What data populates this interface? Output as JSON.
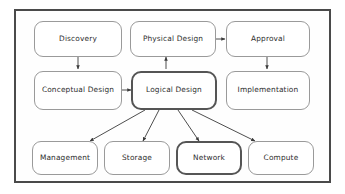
{
  "diagram": {
    "frame": {
      "border_color": "#4a4a4a"
    },
    "node_style": {
      "fill": "#ffffff",
      "border_color": "#9a9a9a",
      "emphasis_border_color": "#555555",
      "text_color": "#2d2d2d"
    },
    "connector_color": "#3a3a3a",
    "rows": [
      {
        "name": "row-top",
        "nodes": [
          {
            "id": "discovery",
            "label": "Discovery",
            "emphasis": false
          },
          {
            "id": "physical-design",
            "label": "Physical Design",
            "emphasis": false
          },
          {
            "id": "approval",
            "label": "Approval",
            "emphasis": false
          }
        ]
      },
      {
        "name": "row-middle",
        "nodes": [
          {
            "id": "conceptual-design",
            "label": "Conceptual Design",
            "emphasis": false
          },
          {
            "id": "logical-design",
            "label": "Logical Design",
            "emphasis": true
          },
          {
            "id": "implementation",
            "label": "Implementation",
            "emphasis": false
          }
        ]
      },
      {
        "name": "row-bottom",
        "nodes": [
          {
            "id": "management",
            "label": "Management",
            "emphasis": false
          },
          {
            "id": "storage",
            "label": "Storage",
            "emphasis": false
          },
          {
            "id": "network",
            "label": "Network",
            "emphasis": true
          },
          {
            "id": "compute",
            "label": "Compute",
            "emphasis": false
          }
        ]
      }
    ],
    "edges": [
      {
        "id": "discovery-to-conceptual",
        "from": "discovery",
        "to": "conceptual-design",
        "direction": "down"
      },
      {
        "id": "logical-to-physical",
        "from": "logical-design",
        "to": "physical-design",
        "direction": "up"
      },
      {
        "id": "physical-to-approval",
        "from": "physical-design",
        "to": "approval",
        "direction": "right"
      },
      {
        "id": "approval-to-implementation",
        "from": "approval",
        "to": "implementation",
        "direction": "down"
      },
      {
        "id": "conceptual-to-logical",
        "from": "conceptual-design",
        "to": "logical-design",
        "direction": "right"
      },
      {
        "id": "logical-to-management",
        "from": "logical-design",
        "to": "management",
        "direction": "diagonal-down-left"
      },
      {
        "id": "logical-to-storage",
        "from": "logical-design",
        "to": "storage",
        "direction": "diagonal-down-left"
      },
      {
        "id": "logical-to-network",
        "from": "logical-design",
        "to": "network",
        "direction": "diagonal-down-right"
      },
      {
        "id": "logical-to-compute",
        "from": "logical-design",
        "to": "compute",
        "direction": "diagonal-down-right"
      }
    ]
  }
}
